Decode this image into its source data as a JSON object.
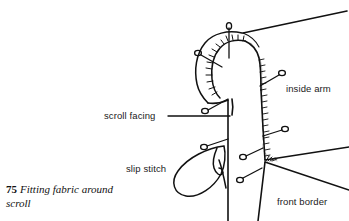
{
  "figure": {
    "number": "75",
    "caption_text": "Fitting fabric around scroll",
    "domain_kind": "line-art technical illustration",
    "background_color": "#ffffff",
    "ink_color": "#111111",
    "faint_guide_color": "#b9b9b9"
  },
  "labels": {
    "scroll_facing": "scroll facing",
    "inside_arm": "inside arm",
    "slip_stitch": "slip stitch",
    "front_border": "front border"
  },
  "drawing": {
    "pin_count": 8,
    "pin_head_shape": "small open ellipse",
    "stitch_marks": "short hatch ticks along seam edges",
    "elements": [
      "scroll outer curve",
      "scroll inner curve with stitching",
      "inside arm panel",
      "front border seam lines",
      "slip stitch thread loop",
      "faint construction guide line"
    ]
  }
}
